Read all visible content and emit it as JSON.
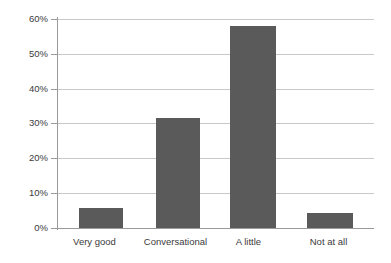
{
  "chart_data": {
    "type": "bar",
    "title": "",
    "subtitle": "",
    "xlabel": "",
    "ylabel": "",
    "categories": [
      "Very good",
      "Conversational",
      "A little",
      "Not at all"
    ],
    "values": [
      5.8,
      31.5,
      58.0,
      4.2
    ],
    "value_labels": [
      "",
      "",
      "",
      ""
    ],
    "ylim": [
      0,
      60
    ],
    "ytick_labels": [
      "0%",
      "10%",
      "20%",
      "30%",
      "40%",
      "50%",
      "60%"
    ],
    "ytick_values": [
      0,
      10,
      20,
      30,
      40,
      50,
      60
    ],
    "grid": "horizontal",
    "legend": "none",
    "bar_color": "#5a5a5a",
    "grid_color": "#c8c8c8",
    "axis_color": "#9a9a9a",
    "text_color": "#3b3b3b",
    "background": "#ffffff"
  }
}
